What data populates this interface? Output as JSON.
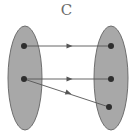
{
  "title": "C",
  "colors": {
    "set_fill": "#a8a8a8",
    "set_stroke": "#6e6e6e",
    "dot": "#2e2e2e",
    "arrow": "#555555",
    "title": "#6a6a6a"
  },
  "sets": [
    {
      "name": "domain",
      "cx": 25,
      "cy": 78,
      "rx": 17,
      "ry": 52
    },
    {
      "name": "codomain",
      "cx": 111,
      "cy": 78,
      "rx": 17,
      "ry": 52
    }
  ],
  "domain_points": [
    {
      "id": "a1",
      "x": 24,
      "y": 46
    },
    {
      "id": "a2",
      "x": 24,
      "y": 79
    }
  ],
  "codomain_points": [
    {
      "id": "b1",
      "x": 111,
      "y": 46
    },
    {
      "id": "b2",
      "x": 111,
      "y": 79
    },
    {
      "id": "b3",
      "x": 109,
      "y": 107
    }
  ],
  "mappings": [
    {
      "from": "a1",
      "to": "b1"
    },
    {
      "from": "a2",
      "to": "b2"
    },
    {
      "from": "a2",
      "to": "b3"
    }
  ]
}
